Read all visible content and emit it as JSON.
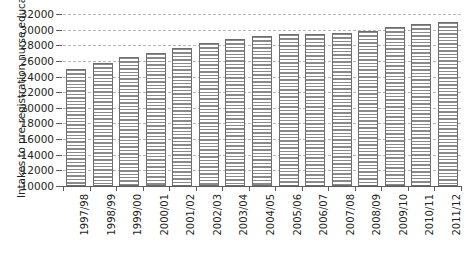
{
  "chart_data": {
    "type": "bar",
    "title": "",
    "subtitle": "",
    "xlabel": "",
    "ylabel": "Intakes to pre-registration nurse education",
    "categories": [
      "1997/98",
      "1998/99",
      "1999/00",
      "2000/01",
      "2001/02",
      "2002/03",
      "2003/04",
      "2004/05",
      "2005/06",
      "2006/07",
      "2007/08",
      "2008/09",
      "2009/10",
      "2010/11",
      "2011/12"
    ],
    "values": [
      25000,
      25700,
      26500,
      27000,
      27600,
      28300,
      28800,
      29200,
      29400,
      29400,
      29600,
      29800,
      30300,
      30700,
      31000
    ],
    "ylim": [
      10000,
      32000
    ],
    "ytick_labels": [
      "32000",
      "30000",
      "28000",
      "26000",
      "24000",
      "22000",
      "20000",
      "18000",
      "16000",
      "14000",
      "12000",
      "10000"
    ],
    "ytick_values": [
      32000,
      30000,
      28000,
      26000,
      24000,
      22000,
      20000,
      18000,
      16000,
      14000,
      12000,
      10000
    ],
    "grid": true,
    "grid_style": "dashed",
    "legend": null,
    "legend_position": "none",
    "bar_fill": "horizontal-hatch",
    "bar_color": "#8a8a8a",
    "bar_edge_color": "#6e6e6e",
    "axis_color": "#5c5c5c",
    "grid_color": "#b9b9b9",
    "text_color": "#231f20",
    "background": "#ffffff"
  }
}
